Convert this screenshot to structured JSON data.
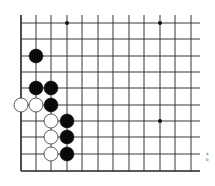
{
  "diagram": {
    "type": "go-board-corner",
    "grid": {
      "x_lines": [
        21,
        36,
        51,
        67,
        82,
        98,
        113,
        129,
        144,
        160,
        175,
        191
      ],
      "y_lines": [
        23,
        39,
        56,
        72,
        88,
        105,
        121,
        137,
        154,
        171
      ],
      "left_edge": 21,
      "bottom_edge": 171,
      "open_top": 15,
      "open_right": 200,
      "line_color": "#222222",
      "edge_width": 1.6,
      "line_width": 0.9
    },
    "star_points": [
      [
        3,
        0
      ],
      [
        9,
        0
      ],
      [
        9,
        6
      ]
    ],
    "stones": [
      {
        "color": "black",
        "col": 1,
        "row": 2
      },
      {
        "color": "black",
        "col": 1,
        "row": 4
      },
      {
        "color": "black",
        "col": 2,
        "row": 4
      },
      {
        "color": "white",
        "col": 0,
        "row": 5
      },
      {
        "color": "white",
        "col": 1,
        "row": 5
      },
      {
        "color": "black",
        "col": 2,
        "row": 5
      },
      {
        "color": "white",
        "col": 2,
        "row": 6
      },
      {
        "color": "black",
        "col": 3,
        "row": 6
      },
      {
        "color": "white",
        "col": 2,
        "row": 7
      },
      {
        "color": "black",
        "col": 3,
        "row": 7
      },
      {
        "color": "white",
        "col": 2,
        "row": 8
      },
      {
        "color": "black",
        "col": 3,
        "row": 8
      }
    ],
    "stone_radius": 7,
    "colors": {
      "black": "#0a0a0a",
      "white": "#ffffff",
      "white_stroke": "#333333"
    },
    "side_marks": [
      "a",
      "b"
    ]
  }
}
